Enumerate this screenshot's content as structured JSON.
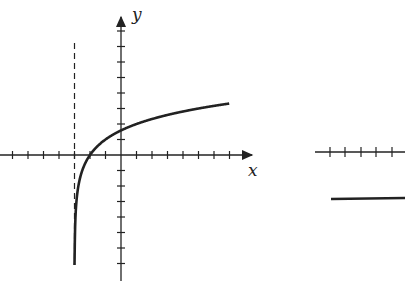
{
  "chart_data": {
    "type": "line",
    "title": "",
    "xlabel": "x",
    "ylabel": "y",
    "function": "y = log2(x + 3)",
    "vertical_asymptote": -3,
    "x_intercept": -2,
    "y_intercept": 1.58,
    "x": [
      -2.95,
      -2.9,
      -2.75,
      -2.5,
      -2,
      -1,
      0,
      1,
      2,
      3,
      4,
      5,
      6,
      7
    ],
    "series": [
      {
        "name": "curve",
        "values": [
          -4.32,
          -3.32,
          -2.0,
          -1.0,
          0,
          1.0,
          1.58,
          2.0,
          2.32,
          2.58,
          2.81,
          3.0,
          3.17,
          3.32
        ]
      }
    ],
    "xlim": [
      -7,
      8
    ],
    "ylim": [
      -7,
      7
    ],
    "grid": false,
    "tick_spacing": 1
  },
  "labels": {
    "x_axis": "x",
    "y_axis": "y"
  }
}
